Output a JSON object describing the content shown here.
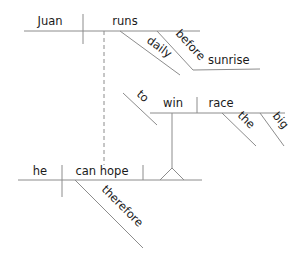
{
  "diagram": {
    "type": "Reed-Kellogg sentence diagram",
    "sentence_parts": {
      "clause1": {
        "subject": "Juan",
        "verb": "runs",
        "modifiers": [
          "daily",
          "before"
        ],
        "object_of_preposition": "sunrise"
      },
      "infinitive_phrase": {
        "marker": "to",
        "verb": "win",
        "object": "race",
        "modifiers": [
          "the",
          "big"
        ]
      },
      "clause2": {
        "subject": "he",
        "verb": "can hope",
        "modifiers": [
          "therefore"
        ]
      }
    },
    "words": {
      "juan": "Juan",
      "runs": "runs",
      "daily": "daily",
      "before": "before",
      "sunrise": "sunrise",
      "to": "to",
      "win": "win",
      "race": "race",
      "the": "the",
      "big": "big",
      "he": "he",
      "can_hope": "can hope",
      "therefore": "therefore"
    },
    "colors": {
      "line": "#8c8c8c",
      "text": "#1a1a1a",
      "background": "#ffffff"
    }
  }
}
